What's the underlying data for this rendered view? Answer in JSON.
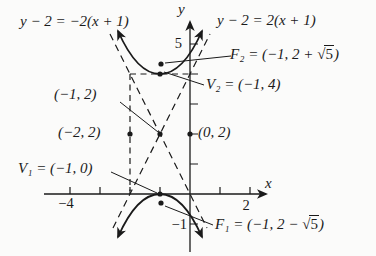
{
  "colors": {
    "ink": "#1a1a1a",
    "background": "#fbfbfa"
  },
  "equations": {
    "left_asymptote": "y − 2 = −2(x + 1)",
    "right_asymptote": "y − 2 = 2(x + 1)"
  },
  "points": {
    "f2": {
      "pre": "F₂ = (−1, 2 + ",
      "sqrt": "√",
      "radicand": "5",
      "post": ")"
    },
    "v2": "V₂ = (−1, 4)",
    "center": "(−1, 2)",
    "box_left": "(−2, 2)",
    "box_right": "(0, 2)",
    "v1": "V₁ = (−1, 0)",
    "f1": {
      "pre": "F₁ = (−1, 2 − ",
      "sqrt": "√",
      "radicand": "5",
      "post": ")"
    }
  },
  "axes": {
    "x_label": "x",
    "y_label": "y",
    "x_tick_neg4": "−4",
    "x_tick_2": "2",
    "y_tick_5": "5",
    "y_tick_neg1": "−1"
  }
}
